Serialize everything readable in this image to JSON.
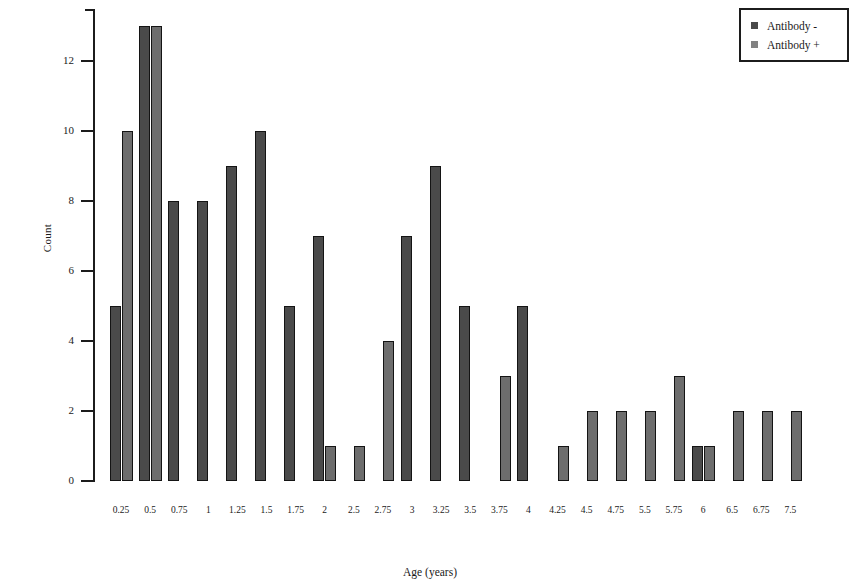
{
  "chart_data": {
    "type": "bar",
    "title": "",
    "xlabel": "Age (years)",
    "ylabel": "Count",
    "ylim": [
      0,
      13.5
    ],
    "y_ticks": [
      0,
      2,
      4,
      6,
      8,
      10,
      12
    ],
    "grid": false,
    "legend_position": "top-right",
    "categories": [
      "0.25",
      "0.5",
      "0.75",
      "1",
      "1.25",
      "1.5",
      "1.75",
      "2",
      "2.5",
      "2.75",
      "3",
      "3.25",
      "3.5",
      "3.75",
      "4",
      "4.25",
      "4.5",
      "4.75",
      "5.5",
      "5.75",
      "6",
      "6.5",
      "6.75",
      "7.5"
    ],
    "series": [
      {
        "name": "Antibody -",
        "color": "#4a4a4a",
        "values": [
          5,
          13,
          8,
          8,
          9,
          10,
          5,
          7,
          0,
          0,
          7,
          9,
          5,
          0,
          5,
          0,
          0,
          0,
          0,
          0,
          1,
          0,
          0,
          0
        ]
      },
      {
        "name": "Antibody +",
        "color": "#6d6d6d",
        "values": [
          10,
          13,
          0,
          0,
          0,
          0,
          0,
          1,
          1,
          4,
          0,
          0,
          0,
          3,
          0,
          1,
          2,
          2,
          2,
          3,
          1,
          2,
          2,
          2
        ]
      }
    ]
  },
  "legend": {
    "items": [
      {
        "label": "Antibody -",
        "kind": "neg"
      },
      {
        "label": "Antibody +",
        "kind": "pos"
      }
    ]
  },
  "axes": {
    "y_title": "Count",
    "x_title": "Age (years)"
  }
}
